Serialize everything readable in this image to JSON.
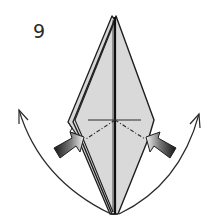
{
  "diagram": {
    "type": "origami-instruction-step",
    "step_number": "9",
    "colors": {
      "paper_fill": "#d9d9d9",
      "paper_fill_light": "#e4e4e4",
      "outline": "#1e1e1e",
      "background": "#ffffff",
      "push_arrow_dark": "#1a1a1a",
      "push_arrow_light": "#f0f0f0"
    },
    "elements": {
      "paper_shape": "kite / diamond-shaped folded paper with layered left edge",
      "center_crease": "vertical center line",
      "mountain_line": "horizontal fold line across the middle",
      "valley_lines": [
        "dash-dot line from center to lower-left",
        "dash-dot line from center to lower-right"
      ],
      "push_arrows": [
        "left push arrow pointing inward",
        "right push arrow pointing inward"
      ],
      "curved_arrows": [
        "left curved arrow swinging flap up-left",
        "right curved arrow swinging flap up-right"
      ]
    }
  }
}
